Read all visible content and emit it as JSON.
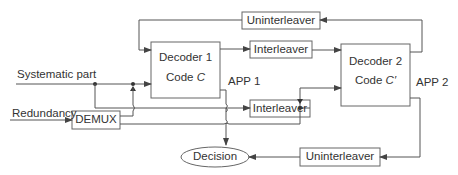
{
  "diagram": {
    "inputs": {
      "systematic": "Systematic part",
      "redundancy": "Redundancy"
    },
    "blocks": {
      "demux": "DEMUX",
      "decoder1": {
        "name": "Decoder 1",
        "code_prefix": "Code ",
        "code_symbol": "C"
      },
      "decoder2": {
        "name": "Decoder 2",
        "code_prefix": "Code ",
        "code_symbol": "C′"
      },
      "interleaver_top": "Interleaver",
      "interleaver_mid": "Interleaver",
      "uninterleaver_top": "Uninterleaver",
      "uninterleaver_bottom": "Uninterleaver",
      "decision": "Decision"
    },
    "outputs": {
      "app1": "APP 1",
      "app2": "APP 2"
    },
    "colors": {
      "line": "#555555",
      "text": "#333333",
      "background": "#ffffff"
    }
  }
}
